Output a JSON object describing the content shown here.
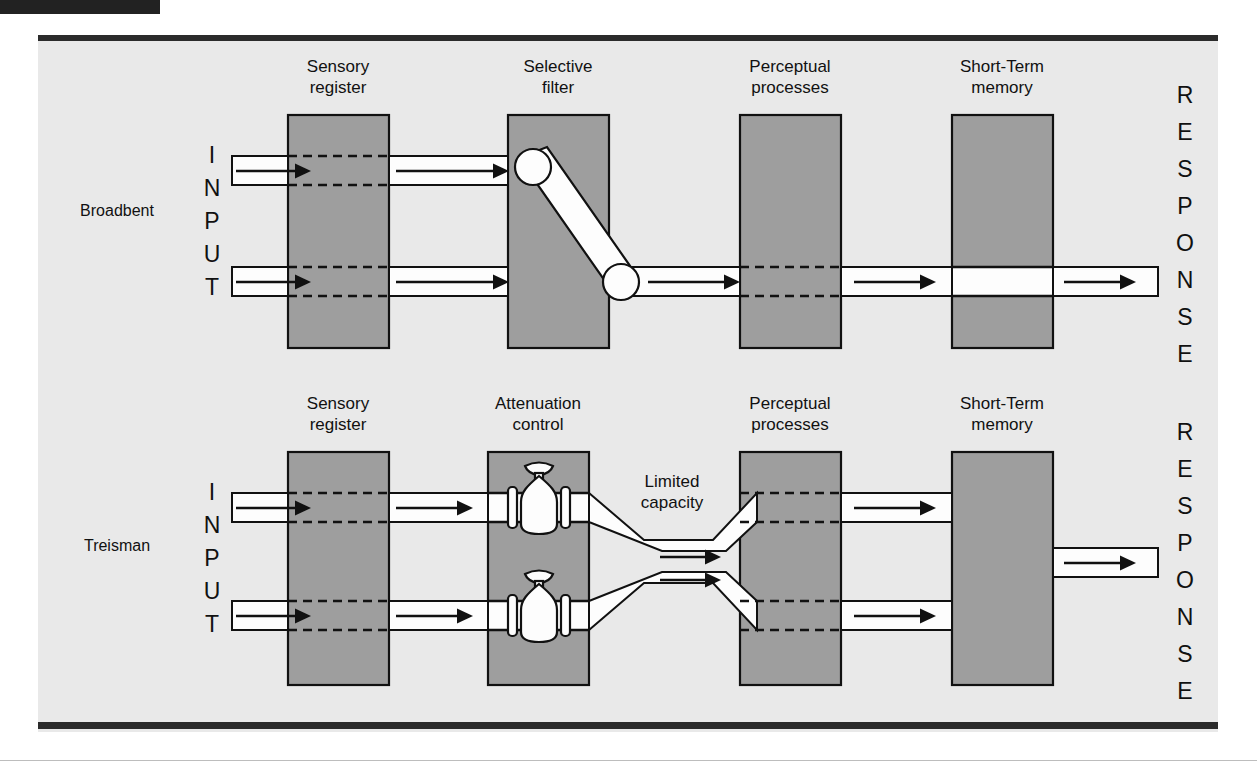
{
  "figure": {
    "title_bar": "",
    "models": [
      {
        "id": "broadbent",
        "label": "Broadbent",
        "input_label": "INPUT",
        "output_label": "RESPONSE",
        "stages": [
          {
            "name": "sensory-register",
            "line1": "Sensory",
            "line2": "register"
          },
          {
            "name": "selective-filter",
            "line1": "Selective",
            "line2": "filter"
          },
          {
            "name": "perceptual-processes",
            "line1": "Perceptual",
            "line2": "processes"
          },
          {
            "name": "short-term-memory",
            "line1": "Short-Term",
            "line2": "memory"
          }
        ],
        "mechanism": "selective-filter-switch",
        "annotations": []
      },
      {
        "id": "treisman",
        "label": "Treisman",
        "input_label": "INPUT",
        "output_label": "RESPONSE",
        "stages": [
          {
            "name": "sensory-register",
            "line1": "Sensory",
            "line2": "register"
          },
          {
            "name": "attenuation-control",
            "line1": "Attenuation",
            "line2": "control"
          },
          {
            "name": "perceptual-processes",
            "line1": "Perceptual",
            "line2": "processes"
          },
          {
            "name": "short-term-memory",
            "line1": "Short-Term",
            "line2": "memory"
          }
        ],
        "mechanism": "attenuation-valves",
        "annotations": [
          {
            "name": "limited-capacity-label",
            "line1": "Limited",
            "line2": "capacity"
          }
        ]
      }
    ],
    "colors": {
      "box_fill": "#9e9e9e",
      "panel_bg": "#e9e9e9",
      "channel_fill": "#fdfdfd",
      "ink": "#111111",
      "rule": "#2b2b2b"
    }
  }
}
